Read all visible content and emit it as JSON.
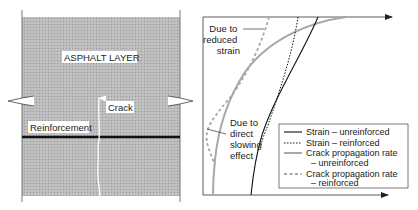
{
  "left_panel": {
    "layer_label": "ASPHALT LAYER",
    "crack_label": "Crack",
    "reinforcement_label": "Reinforcement",
    "colors": {
      "asphalt_fill": "#b9b9b9",
      "reinforcement": "#111111",
      "crack": "#ffffff"
    }
  },
  "right_panel": {
    "annotations": {
      "reduced_strain": [
        "Due to",
        "reduced",
        "strain"
      ],
      "direct_slowing": [
        "Due to",
        "direct",
        "slowing",
        "effect"
      ]
    },
    "legend": [
      {
        "line_style": "solid-black",
        "text": [
          "Strain – unreinforced"
        ]
      },
      {
        "line_style": "dotted-black",
        "text": [
          "Strain – reinforced"
        ]
      },
      {
        "line_style": "solid-gray",
        "text": [
          "Crack propagation rate",
          "– unreinforced"
        ]
      },
      {
        "line_style": "dashed-gray",
        "text": [
          "Crack propagation rate",
          "– reinforced"
        ]
      }
    ],
    "colors": {
      "strain": "#111111",
      "crack_rate": "#a8a8a8",
      "axis": "#333333"
    }
  }
}
